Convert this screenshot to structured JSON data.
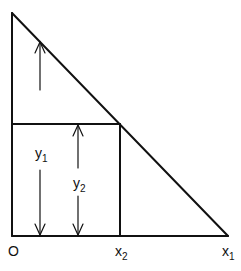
{
  "diagram": {
    "type": "geometric-figure",
    "stroke_color": "#111111",
    "labels": {
      "origin": "O",
      "x2": {
        "base": "x",
        "sub": "2"
      },
      "x1": {
        "base": "x",
        "sub": "1"
      },
      "y1": {
        "base": "y",
        "sub": "1"
      },
      "y2": {
        "base": "y",
        "sub": "2"
      }
    }
  }
}
